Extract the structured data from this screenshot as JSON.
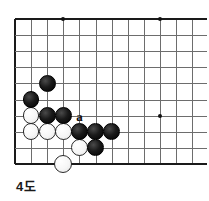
{
  "diagram": {
    "caption": "4도",
    "kind": "go-board-diagram",
    "board": {
      "origin_x": 15,
      "origin_y": 19,
      "spacing": 16.1,
      "cols": 12,
      "rows": 10,
      "line_color": "#6d6d6d",
      "edge_color": "#1a1a1a",
      "background": "#ffffff",
      "edges": {
        "left": true,
        "top": true,
        "right": false,
        "bottom": true
      }
    },
    "star_points": [
      {
        "col": 3,
        "row": 0
      },
      {
        "col": 9,
        "row": 0
      },
      {
        "col": 9,
        "row": 6
      }
    ],
    "stones": [
      {
        "color": "black",
        "col": 2,
        "row": 4,
        "radius": 8.4
      },
      {
        "color": "black",
        "col": 1,
        "row": 5,
        "radius": 8.4
      },
      {
        "color": "white",
        "col": 1,
        "row": 6,
        "radius": 8.4
      },
      {
        "color": "black",
        "col": 2,
        "row": 6,
        "radius": 8.4
      },
      {
        "color": "black",
        "col": 3,
        "row": 6,
        "radius": 8.4
      },
      {
        "color": "white",
        "col": 1,
        "row": 7,
        "radius": 8.4
      },
      {
        "color": "white",
        "col": 2,
        "row": 7,
        "radius": 8.4
      },
      {
        "color": "white",
        "col": 3,
        "row": 7,
        "radius": 8.4
      },
      {
        "color": "black",
        "col": 4,
        "row": 7,
        "radius": 8.4
      },
      {
        "color": "black",
        "col": 5,
        "row": 7,
        "radius": 8.4
      },
      {
        "color": "black",
        "col": 6,
        "row": 7,
        "radius": 8.4
      },
      {
        "color": "white",
        "col": 4,
        "row": 8,
        "radius": 8.4
      },
      {
        "color": "black",
        "col": 5,
        "row": 8,
        "radius": 8.4
      },
      {
        "color": "white",
        "col": 3,
        "row": 9,
        "radius": 9.2
      }
    ],
    "markers": [
      {
        "label": "a",
        "col": 4,
        "row": 6
      }
    ]
  }
}
